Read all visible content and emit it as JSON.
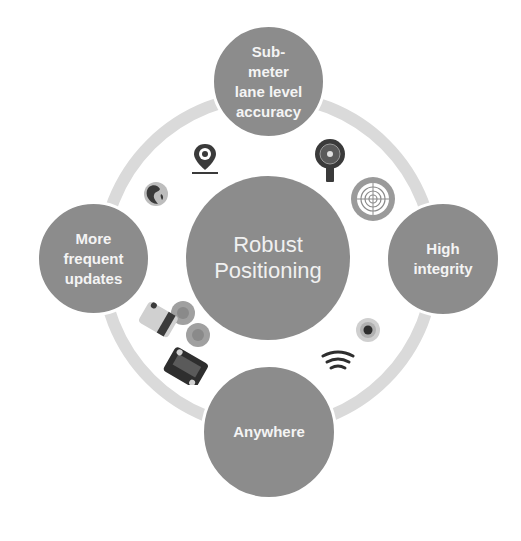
{
  "diagram": {
    "type": "hub-and-ring",
    "colors": {
      "node_fill": "#8c8c8c",
      "ring": "#dadada",
      "text": "#f4f4f4",
      "icon_dark": "#3a3a3a",
      "background": "#ffffff"
    },
    "center": {
      "lines": [
        "Robust",
        "Positioning"
      ]
    },
    "nodes": {
      "top": {
        "lines": [
          "Sub-",
          "meter",
          "lane level",
          "accuracy"
        ]
      },
      "right": {
        "lines": [
          "High",
          "integrity"
        ]
      },
      "bottom": {
        "lines": [
          "Anywhere"
        ]
      },
      "left": {
        "lines": [
          "More",
          "frequent",
          "updates"
        ]
      }
    },
    "icons": [
      {
        "name": "location-pin-icon",
        "position": "upper-left-inner"
      },
      {
        "name": "globe-icon",
        "position": "upper-left-inner"
      },
      {
        "name": "magnifier-target-icon",
        "position": "upper-right-inner"
      },
      {
        "name": "radar-target-icon",
        "position": "upper-right-inner"
      },
      {
        "name": "connected-cars-icon",
        "position": "lower-left-inner"
      },
      {
        "name": "signal-dot-icon",
        "position": "lower-right-inner"
      },
      {
        "name": "wireless-signal-icon",
        "position": "lower-right-inner"
      }
    ]
  }
}
